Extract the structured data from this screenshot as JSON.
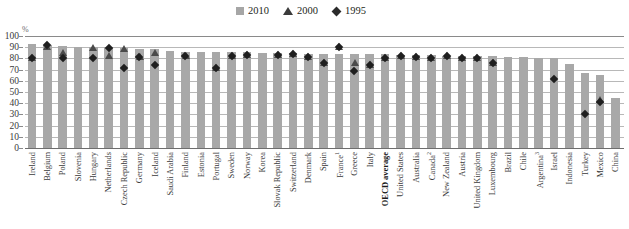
{
  "chart_data": {
    "type": "bar",
    "title": "",
    "subtitle": "",
    "xlabel": "",
    "ylabel": "%",
    "ylim": [
      0,
      100
    ],
    "yticks": [
      0,
      10,
      20,
      30,
      40,
      50,
      60,
      70,
      80,
      90,
      100
    ],
    "grid": true,
    "legend_position": "top-right",
    "legend": [
      {
        "label": "2010",
        "marker": "square",
        "color": "#a6a6a6"
      },
      {
        "label": "2000",
        "marker": "triangle",
        "color": "#3b3b3b"
      },
      {
        "label": "1995",
        "marker": "diamond",
        "color": "#2b2b2b"
      }
    ],
    "categories": [
      "Ireland",
      "Belgium",
      "Poland",
      "Slovenia",
      "Hungary",
      "Netherlands",
      "Czech Republic",
      "Germany",
      "Iceland",
      "Saudi Arabia",
      "Finland",
      "Estonia",
      "Portugal",
      "Sweden",
      "Norway",
      "Korea",
      "Slovak Republic",
      "Switzerland",
      "Denmark",
      "Spain",
      "France",
      "Greece",
      "Italy",
      "OECD average",
      "United States",
      "Australia",
      "Canada",
      "New Zealand",
      "Austria",
      "United Kingdom",
      "Luxembourg",
      "Brazil",
      "Chile",
      "Argentina",
      "Israel",
      "Indonesia",
      "Turkey",
      "Mexico",
      "China"
    ],
    "category_footnotes": {
      "France": "1",
      "Canada": "2",
      "Argentina": "3"
    },
    "category_emphasis": [
      "OECD average"
    ],
    "series": [
      {
        "name": "2010",
        "marker": "bar",
        "values": [
          93,
          92,
          91,
          90,
          90,
          90,
          89,
          88,
          88,
          87,
          86,
          86,
          86,
          86,
          86,
          85,
          85,
          85,
          84,
          84,
          84,
          84,
          84,
          84,
          83,
          83,
          83,
          82,
          82,
          82,
          82,
          81,
          81,
          80,
          80,
          75,
          67,
          65,
          45
        ]
      },
      {
        "name": "2000",
        "marker": "triangle",
        "values": [
          80,
          90,
          85,
          null,
          89,
          82,
          88,
          81,
          85,
          null,
          82,
          null,
          71,
          82,
          83,
          null,
          83,
          84,
          81,
          76,
          90,
          76,
          74,
          80,
          82,
          81,
          80,
          82,
          80,
          80,
          76,
          null,
          null,
          null,
          null,
          null,
          null,
          43,
          null
        ]
      },
      {
        "name": "1995",
        "marker": "diamond",
        "values": [
          80,
          92,
          80,
          null,
          80,
          89,
          71,
          81,
          74,
          null,
          82,
          null,
          71,
          82,
          83,
          null,
          83,
          84,
          81,
          76,
          90,
          69,
          74,
          80,
          82,
          81,
          80,
          82,
          80,
          80,
          76,
          null,
          null,
          null,
          62,
          null,
          30,
          41,
          null
        ]
      }
    ]
  },
  "axis": {
    "unit_label": "%"
  }
}
